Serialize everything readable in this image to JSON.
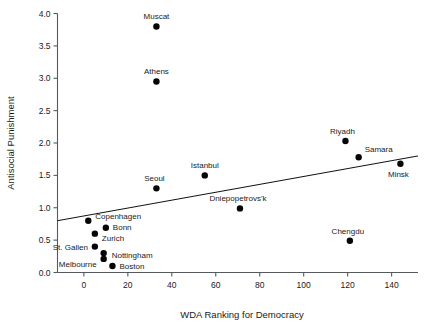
{
  "chart_data": {
    "type": "scatter",
    "title": "",
    "xlabel": "WDA Ranking for Democracy",
    "ylabel": "Antisocial Punishment",
    "xlim": [
      -12,
      152
    ],
    "ylim": [
      0.0,
      4.0
    ],
    "xticks": [
      0,
      20,
      40,
      60,
      80,
      100,
      120,
      140
    ],
    "xticklabels": [
      "0",
      "20",
      "40",
      "60",
      "80",
      "100",
      "120",
      "140"
    ],
    "yticks": [
      0.0,
      0.5,
      1.0,
      1.5,
      2.0,
      2.5,
      3.0,
      3.5,
      4.0
    ],
    "yticklabels": [
      "0.0",
      "0.5",
      "1.0",
      "1.5",
      "2.0",
      "2.5",
      "3.0",
      "3.5",
      "4.0"
    ],
    "grid": false,
    "legend": null,
    "marker_color": "#050505",
    "line_color": "#111111",
    "axis_color": "#555a5e",
    "points": [
      {
        "label": "Muscat",
        "x": 33,
        "y": 3.8,
        "label_dx": 0,
        "label_dy": -7,
        "anchor": "middle"
      },
      {
        "label": "Athens",
        "x": 33,
        "y": 2.95,
        "label_dx": 0,
        "label_dy": -7,
        "anchor": "middle"
      },
      {
        "label": "Riyadh",
        "x": 119,
        "y": 2.03,
        "label_dx": -3,
        "label_dy": -7,
        "anchor": "middle"
      },
      {
        "label": "Samara",
        "x": 125,
        "y": 1.78,
        "label_dx": 6,
        "label_dy": -5,
        "anchor": "start"
      },
      {
        "label": "Minsk",
        "x": 144,
        "y": 1.68,
        "label_dx": -2,
        "label_dy": 13,
        "anchor": "middle"
      },
      {
        "label": "Istanbul",
        "x": 55,
        "y": 1.5,
        "label_dx": 0,
        "label_dy": -7,
        "anchor": "middle"
      },
      {
        "label": "Seoul",
        "x": 33,
        "y": 1.3,
        "label_dx": -2,
        "label_dy": -7,
        "anchor": "middle"
      },
      {
        "label": "Dniepopetrovs'k",
        "x": 71,
        "y": 0.99,
        "label_dx": -2,
        "label_dy": -7,
        "anchor": "middle"
      },
      {
        "label": "Copenhagen",
        "x": 2,
        "y": 0.8,
        "label_dx": 7,
        "label_dy": -2,
        "anchor": "start"
      },
      {
        "label": "Bonn",
        "x": 10,
        "y": 0.69,
        "label_dx": 7,
        "label_dy": 2,
        "anchor": "start"
      },
      {
        "label": "Zurich",
        "x": 5,
        "y": 0.6,
        "label_dx": 7,
        "label_dy": 7,
        "anchor": "start"
      },
      {
        "label": "St. Gallen",
        "x": 5,
        "y": 0.4,
        "label_dx": -7,
        "label_dy": 3,
        "anchor": "end"
      },
      {
        "label": "Nottingham",
        "x": 9,
        "y": 0.3,
        "label_dx": 8,
        "label_dy": 5,
        "anchor": "start"
      },
      {
        "label": "Melbourne",
        "x": 9,
        "y": 0.21,
        "label_dx": -7,
        "label_dy": 8,
        "anchor": "end"
      },
      {
        "label": "Boston",
        "x": 13,
        "y": 0.1,
        "label_dx": 7,
        "label_dy": 3,
        "anchor": "start"
      },
      {
        "label": "Chengdu",
        "x": 121,
        "y": 0.49,
        "label_dx": -2,
        "label_dy": -7,
        "anchor": "middle"
      }
    ],
    "fit_line": {
      "x_start": -12,
      "y_start": 0.8,
      "x_end": 152,
      "y_end": 1.8
    }
  }
}
